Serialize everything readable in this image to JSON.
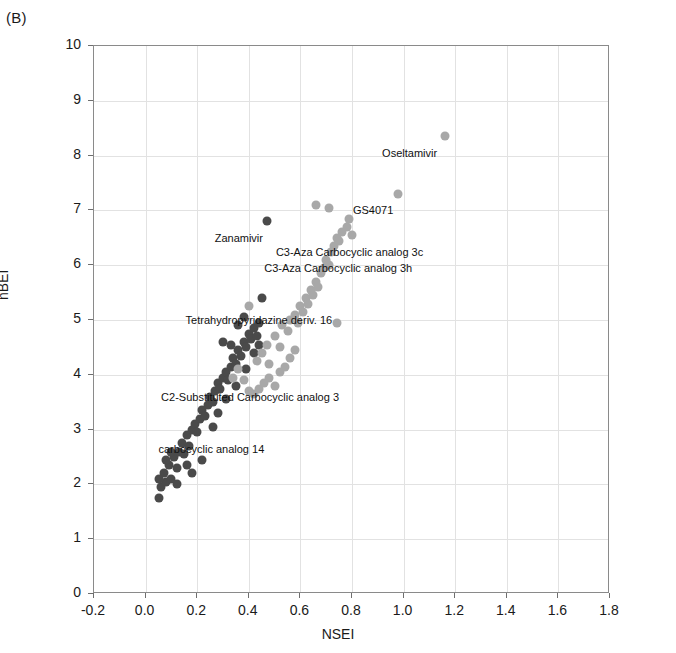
{
  "panel": {
    "label": "(B)"
  },
  "chart_data": {
    "type": "scatter",
    "title": "",
    "xlabel": "NSEI",
    "ylabel": "nBEI",
    "xlim": [
      -0.2,
      1.8
    ],
    "ylim": [
      0,
      10
    ],
    "xticks": [
      "-0.2",
      "0.0",
      "0.2",
      "0.4",
      "0.6",
      "0.8",
      "1.0",
      "1.2",
      "1.4",
      "1.6",
      "1.8"
    ],
    "yticks": [
      "0",
      "1",
      "2",
      "3",
      "4",
      "5",
      "6",
      "7",
      "8",
      "9",
      "10"
    ],
    "grid": true,
    "legend": "none",
    "series": [
      {
        "name": "dark-series",
        "color": "#4a4a4a",
        "points": [
          [
            0.05,
            1.75
          ],
          [
            0.06,
            1.95
          ],
          [
            0.08,
            2.05
          ],
          [
            0.07,
            2.2
          ],
          [
            0.1,
            2.1
          ],
          [
            0.09,
            2.35
          ],
          [
            0.12,
            2.3
          ],
          [
            0.11,
            2.5
          ],
          [
            0.13,
            2.6
          ],
          [
            0.15,
            2.55
          ],
          [
            0.14,
            2.75
          ],
          [
            0.16,
            2.9
          ],
          [
            0.17,
            2.7
          ],
          [
            0.18,
            3.0
          ],
          [
            0.19,
            3.1
          ],
          [
            0.2,
            2.95
          ],
          [
            0.21,
            3.2
          ],
          [
            0.22,
            3.35
          ],
          [
            0.23,
            3.25
          ],
          [
            0.24,
            3.45
          ],
          [
            0.25,
            3.6
          ],
          [
            0.26,
            3.5
          ],
          [
            0.27,
            3.7
          ],
          [
            0.28,
            3.85
          ],
          [
            0.29,
            3.75
          ],
          [
            0.3,
            3.95
          ],
          [
            0.31,
            4.05
          ],
          [
            0.32,
            3.9
          ],
          [
            0.33,
            4.15
          ],
          [
            0.34,
            4.3
          ],
          [
            0.35,
            4.2
          ],
          [
            0.36,
            4.45
          ],
          [
            0.37,
            4.35
          ],
          [
            0.38,
            4.6
          ],
          [
            0.39,
            4.5
          ],
          [
            0.4,
            4.75
          ],
          [
            0.41,
            4.65
          ],
          [
            0.42,
            4.85
          ],
          [
            0.43,
            4.7
          ],
          [
            0.44,
            4.95
          ],
          [
            0.3,
            4.6
          ],
          [
            0.33,
            4.55
          ],
          [
            0.36,
            4.9
          ],
          [
            0.38,
            5.05
          ],
          [
            0.45,
            5.4
          ],
          [
            0.47,
            6.8
          ],
          [
            0.22,
            2.45
          ],
          [
            0.18,
            2.2
          ],
          [
            0.12,
            2.0
          ],
          [
            0.26,
            3.05
          ],
          [
            0.28,
            3.3
          ],
          [
            0.31,
            3.55
          ],
          [
            0.35,
            3.8
          ],
          [
            0.39,
            4.1
          ],
          [
            0.42,
            4.4
          ],
          [
            0.44,
            4.55
          ],
          [
            0.05,
            2.1
          ],
          [
            0.08,
            2.45
          ],
          [
            0.1,
            2.6
          ],
          [
            0.16,
            2.35
          ]
        ]
      },
      {
        "name": "light-series",
        "color": "#a8a8a8",
        "points": [
          [
            0.4,
            5.25
          ],
          [
            0.43,
            4.25
          ],
          [
            0.45,
            4.4
          ],
          [
            0.47,
            4.55
          ],
          [
            0.48,
            4.2
          ],
          [
            0.5,
            4.7
          ],
          [
            0.52,
            4.5
          ],
          [
            0.53,
            4.9
          ],
          [
            0.55,
            4.8
          ],
          [
            0.56,
            5.0
          ],
          [
            0.58,
            5.1
          ],
          [
            0.59,
            4.95
          ],
          [
            0.6,
            5.25
          ],
          [
            0.61,
            5.15
          ],
          [
            0.62,
            5.4
          ],
          [
            0.63,
            5.3
          ],
          [
            0.64,
            5.55
          ],
          [
            0.65,
            5.45
          ],
          [
            0.66,
            5.7
          ],
          [
            0.67,
            5.6
          ],
          [
            0.68,
            5.85
          ],
          [
            0.69,
            5.95
          ],
          [
            0.7,
            6.1
          ],
          [
            0.71,
            6.0
          ],
          [
            0.72,
            6.25
          ],
          [
            0.73,
            6.35
          ],
          [
            0.74,
            6.5
          ],
          [
            0.75,
            6.45
          ],
          [
            0.76,
            6.6
          ],
          [
            0.66,
            7.1
          ],
          [
            0.71,
            7.05
          ],
          [
            0.78,
            6.7
          ],
          [
            0.79,
            6.85
          ],
          [
            0.8,
            6.55
          ],
          [
            0.74,
            4.95
          ],
          [
            0.44,
            3.75
          ],
          [
            0.46,
            3.85
          ],
          [
            0.48,
            3.95
          ],
          [
            0.5,
            3.8
          ],
          [
            0.52,
            4.05
          ],
          [
            0.54,
            4.15
          ],
          [
            0.42,
            3.65
          ],
          [
            0.4,
            3.7
          ],
          [
            0.38,
            3.9
          ],
          [
            0.36,
            4.1
          ],
          [
            0.34,
            3.95
          ],
          [
            0.56,
            4.3
          ],
          [
            0.58,
            4.45
          ],
          [
            0.98,
            7.3
          ],
          [
            1.16,
            8.35
          ]
        ]
      }
    ],
    "annotations": [
      {
        "text": "Oseltamivir",
        "x": 1.13,
        "y": 8.05,
        "align": "right"
      },
      {
        "text": "GS4071",
        "x": 0.96,
        "y": 7.0,
        "align": "right"
      },
      {
        "text": "Zanamivir",
        "x": 0.455,
        "y": 6.5,
        "align": "right"
      },
      {
        "text": "C3-Aza Carbocyclic analog 3c",
        "x": 0.505,
        "y": 6.25,
        "align": "left"
      },
      {
        "text": "C3-Aza Carbocyclic analog 3h",
        "x": 0.46,
        "y": 5.95,
        "align": "left"
      },
      {
        "text": "Tetrahydropyridazine deriv. 16",
        "x": 0.155,
        "y": 5.0,
        "align": "left"
      },
      {
        "text": "C2-Substituted Carbocyclic analog 3",
        "x": 0.06,
        "y": 3.6,
        "align": "left"
      },
      {
        "text": "carbocyclic analog 14",
        "x": 0.05,
        "y": 2.65,
        "align": "left"
      }
    ]
  }
}
